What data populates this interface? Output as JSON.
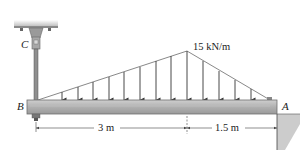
{
  "diagram": {
    "labels": {
      "point_c": "C",
      "point_b": "B",
      "point_a": "A",
      "load_intensity": "15 kN/m"
    },
    "dimensions": {
      "left_span": "3 m",
      "right_span": "1.5 m"
    },
    "colors": {
      "beam": "#b4b4b4",
      "beam_edge": "#7a7a7a",
      "wall": "#c8c8c8",
      "line": "#333333",
      "ceiling": "#bdbdbd"
    }
  }
}
